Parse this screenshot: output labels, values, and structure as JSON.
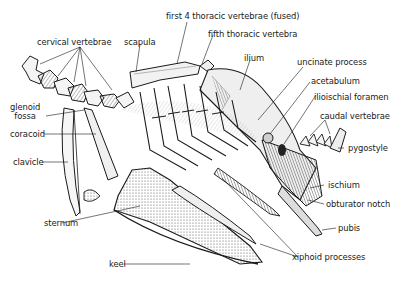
{
  "diagram": {
    "colors": {
      "ink": "#1a1a1a",
      "background": "#ffffff",
      "shade": "#7a7a7a"
    },
    "labels": [
      {
        "id": "cervical-vertebrae",
        "text": "cervical vertebrae"
      },
      {
        "id": "scapula",
        "text": "scapula"
      },
      {
        "id": "first-4-thoracic",
        "text": "first 4 thoracic vertebrae (fused)"
      },
      {
        "id": "fifth-thoracic",
        "text": "fifth thoracic vertebra"
      },
      {
        "id": "ilium",
        "text": "ilium"
      },
      {
        "id": "uncinate-process",
        "text": "uncinate process"
      },
      {
        "id": "acetabulum",
        "text": "acetabulum"
      },
      {
        "id": "ilioischial-foramen",
        "text": "ilioischial foramen"
      },
      {
        "id": "caudal-vertebrae",
        "text": "caudal vertebrae"
      },
      {
        "id": "pygostyle",
        "text": "pygostyle"
      },
      {
        "id": "glenoid-fossa",
        "text": "glenoid\nfossa"
      },
      {
        "id": "coracoid",
        "text": "coracoid"
      },
      {
        "id": "clavicle",
        "text": "clavicle"
      },
      {
        "id": "ischium",
        "text": "ischium"
      },
      {
        "id": "obturator-notch",
        "text": "obturator notch"
      },
      {
        "id": "pubis",
        "text": "pubis"
      },
      {
        "id": "sternum",
        "text": "sternum"
      },
      {
        "id": "xiphoid-processes",
        "text": "xiphoid processes"
      },
      {
        "id": "keel",
        "text": "keel"
      }
    ]
  }
}
